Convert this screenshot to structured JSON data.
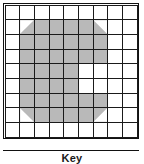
{
  "figure": {
    "title": "",
    "caption": "Key",
    "grid": {
      "rows": 9,
      "cols": 9,
      "cell_fill_color": "#b9b9b9",
      "cell_empty_color": "#ffffff",
      "grid_line_color": "#1a1a1a",
      "frame_color": "#111111",
      "legend_rule_color": "#111111",
      "note": "Shaded cells form a large block letter C / e glyph with diagonally cut outer corners",
      "cells": [
        [
          "off",
          "off",
          "off",
          "off",
          "off",
          "off",
          "off",
          "off",
          "off"
        ],
        [
          "off",
          "cut-tl",
          "on",
          "on",
          "on",
          "on",
          "cut-tr",
          "off",
          "off"
        ],
        [
          "off",
          "on",
          "on",
          "on",
          "on",
          "on",
          "on",
          "off",
          "off"
        ],
        [
          "off",
          "on",
          "on",
          "on",
          "on",
          "on",
          "on",
          "off",
          "off"
        ],
        [
          "off",
          "on",
          "on",
          "on",
          "on",
          "off",
          "off",
          "off",
          "off"
        ],
        [
          "off",
          "on",
          "on",
          "on",
          "on",
          "off",
          "off",
          "off",
          "off"
        ],
        [
          "off",
          "on",
          "on",
          "on",
          "on",
          "on",
          "on",
          "off",
          "off"
        ],
        [
          "off",
          "cut-bl",
          "on",
          "on",
          "on",
          "on",
          "cut-br",
          "off",
          "off"
        ],
        [
          "off",
          "off",
          "off",
          "off",
          "off",
          "off",
          "off",
          "off",
          "off"
        ]
      ]
    }
  }
}
